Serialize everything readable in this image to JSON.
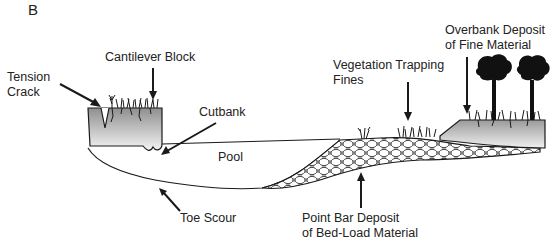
{
  "panel_label": "B",
  "labels": {
    "tension_crack": [
      "Tension",
      "Crack"
    ],
    "cantilever_block": "Cantilever Block",
    "cutbank": "Cutbank",
    "pool": "Pool",
    "toe_scour": "Toe Scour",
    "vegetation_trapping_fines": [
      "Vegetation Trapping",
      "Fines"
    ],
    "overbank_deposit": [
      "Overbank Deposit",
      "of Fine Material"
    ],
    "point_bar_deposit": [
      "Point Bar Deposit",
      "of Bed-Load Material"
    ]
  },
  "colors": {
    "line": "#1a1a1a",
    "bank_top": "#9a9a9a",
    "bank_bottom": "#f2f2f2",
    "text": "#222222"
  }
}
